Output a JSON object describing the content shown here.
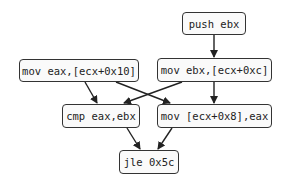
{
  "nodes": {
    "push_ebx": {
      "label": "push ebx"
    },
    "mov_eax": {
      "label": "mov eax,[ecx+0x10]"
    },
    "mov_ebx": {
      "label": "mov ebx,[ecx+0xc]"
    },
    "cmp": {
      "label": "cmp eax,ebx"
    },
    "mov_store": {
      "label": "mov [ecx+0x8],eax"
    },
    "jle": {
      "label": "jle 0x5c"
    }
  },
  "edges": [
    {
      "from": "push ebx",
      "to": "mov ebx,[ecx+0xc]"
    },
    {
      "from": "mov eax,[ecx+0x10]",
      "to": "cmp eax,ebx"
    },
    {
      "from": "mov eax,[ecx+0x10]",
      "to": "mov [ecx+0x8],eax"
    },
    {
      "from": "mov ebx,[ecx+0xc]",
      "to": "cmp eax,ebx"
    },
    {
      "from": "mov ebx,[ecx+0xc]",
      "to": "mov [ecx+0x8],eax"
    },
    {
      "from": "cmp eax,ebx",
      "to": "jle 0x5c"
    },
    {
      "from": "mov [ecx+0x8],eax",
      "to": "jle 0x5c"
    }
  ]
}
